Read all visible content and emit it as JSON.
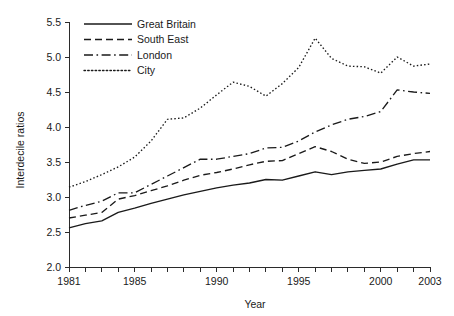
{
  "chart_data": {
    "type": "line",
    "title": "",
    "xlabel": "Year",
    "ylabel": "Interdecile ratios",
    "xlim": [
      1981,
      2003
    ],
    "ylim": [
      2.0,
      5.5
    ],
    "yticks": [
      "2.0",
      "2.5",
      "3.0",
      "3.5",
      "4.0",
      "4.5",
      "5.0",
      "5.5"
    ],
    "ytick_values": [
      2.0,
      2.5,
      3.0,
      3.5,
      4.0,
      4.5,
      5.0,
      5.5
    ],
    "xticks_labeled": [
      "1981",
      "1985",
      "1990",
      "1995",
      "2000",
      "2003"
    ],
    "xtick_values_labeled": [
      1981,
      1985,
      1990,
      1995,
      2000,
      2003
    ],
    "xtick_values_all": [
      1981,
      1982,
      1983,
      1984,
      1985,
      1986,
      1987,
      1988,
      1989,
      1990,
      1991,
      1992,
      1993,
      1994,
      1995,
      1996,
      1997,
      1998,
      1999,
      2000,
      2001,
      2002,
      2003
    ],
    "grid": false,
    "legend_position": "top-left",
    "x": [
      1981,
      1982,
      1983,
      1984,
      1985,
      1986,
      1987,
      1988,
      1989,
      1990,
      1991,
      1992,
      1993,
      1994,
      1995,
      1996,
      1997,
      1998,
      1999,
      2000,
      2001,
      2002,
      2003
    ],
    "series": [
      {
        "name": "Great Britain",
        "line_style": "solid",
        "values": [
          2.56,
          2.62,
          2.66,
          2.78,
          2.84,
          2.91,
          2.97,
          3.03,
          3.08,
          3.13,
          3.17,
          3.2,
          3.25,
          3.24,
          3.3,
          3.36,
          3.32,
          3.36,
          3.38,
          3.4,
          3.47,
          3.53,
          3.53
        ]
      },
      {
        "name": "South East",
        "line_style": "dashed",
        "values": [
          2.7,
          2.74,
          2.78,
          2.97,
          3.02,
          3.09,
          3.16,
          3.24,
          3.31,
          3.35,
          3.4,
          3.46,
          3.51,
          3.52,
          3.62,
          3.72,
          3.65,
          3.54,
          3.48,
          3.5,
          3.58,
          3.62,
          3.65
        ]
      },
      {
        "name": "London",
        "line_style": "dashdot",
        "values": [
          2.81,
          2.88,
          2.94,
          3.06,
          3.06,
          3.18,
          3.3,
          3.42,
          3.54,
          3.54,
          3.58,
          3.62,
          3.7,
          3.71,
          3.8,
          3.93,
          4.03,
          4.11,
          4.15,
          4.22,
          4.53,
          4.5,
          4.48
        ]
      },
      {
        "name": "City",
        "line_style": "dotted",
        "values": [
          3.14,
          3.22,
          3.32,
          3.43,
          3.57,
          3.8,
          4.11,
          4.13,
          4.27,
          4.46,
          4.64,
          4.58,
          4.44,
          4.62,
          4.85,
          5.27,
          4.98,
          4.87,
          4.86,
          4.77,
          5.0,
          4.87,
          4.9
        ]
      }
    ]
  },
  "legend": {
    "items": [
      {
        "label": "Great Britain",
        "style": "solid"
      },
      {
        "label": "South East",
        "style": "dashed"
      },
      {
        "label": "London",
        "style": "dashdot"
      },
      {
        "label": "City",
        "style": "dotted"
      }
    ]
  }
}
